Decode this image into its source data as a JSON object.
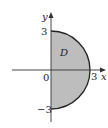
{
  "diagram": {
    "region_label": "D",
    "x_axis_label": "x",
    "y_axis_label": "y",
    "origin_label": "0",
    "x_tick_label": "3",
    "y_top_label": "3",
    "y_bottom_label": "−3",
    "shape": "right half-disk of radius 3 centered at origin",
    "colors": {
      "fill": "#bdbdbd",
      "outline": "#222222",
      "axes": "#333333"
    }
  }
}
